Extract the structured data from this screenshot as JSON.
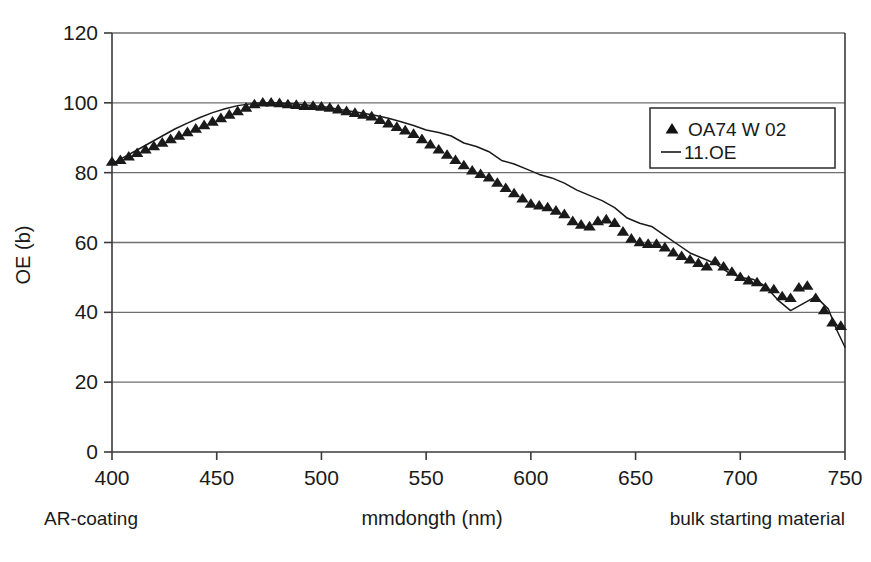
{
  "chart_data": {
    "type": "line",
    "title": "",
    "xlabel": "mmdongth (nm)",
    "ylabel": "OE (b)",
    "xlim": [
      400,
      750
    ],
    "ylim": [
      0,
      120
    ],
    "xticks": [
      400,
      450,
      500,
      550,
      600,
      650,
      700,
      750
    ],
    "yticks": [
      0,
      20,
      40,
      60,
      80,
      100,
      120
    ],
    "grid": "horizontal",
    "legend_position": "upper-right",
    "series": [
      {
        "name": "OA74 W 02",
        "marker": "triangle",
        "style": "markers",
        "x": [
          400,
          404,
          408,
          412,
          416,
          420,
          424,
          428,
          432,
          436,
          440,
          444,
          448,
          452,
          456,
          460,
          464,
          468,
          472,
          476,
          480,
          484,
          488,
          492,
          496,
          500,
          504,
          508,
          512,
          516,
          520,
          524,
          528,
          532,
          536,
          540,
          544,
          548,
          552,
          556,
          560,
          564,
          568,
          572,
          576,
          580,
          584,
          588,
          592,
          596,
          600,
          604,
          608,
          612,
          616,
          620,
          624,
          628,
          632,
          636,
          640,
          644,
          648,
          652,
          656,
          660,
          664,
          668,
          672,
          676,
          680,
          684,
          688,
          692,
          696,
          700,
          704,
          708,
          712,
          716,
          720,
          724,
          728,
          732,
          736,
          740,
          744,
          748
        ],
        "y": [
          83,
          83.5,
          84.5,
          85.5,
          86.5,
          87.5,
          88.5,
          89.5,
          90.5,
          91.5,
          92.5,
          93.5,
          94.5,
          95.5,
          96.5,
          97.5,
          98.5,
          99.5,
          100,
          100,
          99.8,
          99.5,
          99.3,
          99,
          99,
          98.8,
          98.5,
          98,
          97.5,
          97,
          96.5,
          96,
          95,
          94,
          93,
          92,
          91,
          89.5,
          88,
          86.5,
          85,
          83.5,
          82,
          80.5,
          79.5,
          78.5,
          77,
          75.5,
          74,
          72.5,
          71,
          70.5,
          70,
          69,
          68,
          66,
          65,
          64.5,
          66,
          66.5,
          65.5,
          63,
          61,
          60,
          59.5,
          59.5,
          58.5,
          57,
          56,
          55,
          54,
          53,
          54.5,
          53,
          51.5,
          50,
          49,
          48.5,
          47,
          46.5,
          44.5,
          44,
          47,
          47.5,
          44,
          40.5,
          37,
          36
        ]
      },
      {
        "name": "11.OE",
        "marker": "none",
        "style": "line",
        "x": [
          400,
          406,
          412,
          418,
          424,
          430,
          436,
          442,
          448,
          454,
          460,
          466,
          472,
          478,
          484,
          490,
          496,
          502,
          508,
          514,
          520,
          526,
          532,
          538,
          544,
          550,
          556,
          562,
          568,
          574,
          580,
          586,
          592,
          598,
          604,
          610,
          616,
          622,
          628,
          634,
          640,
          646,
          652,
          658,
          664,
          670,
          676,
          682,
          688,
          694,
          700,
          706,
          712,
          718,
          724,
          730,
          736,
          742,
          746,
          750
        ],
        "y": [
          82.5,
          84.5,
          86.5,
          88.5,
          90.5,
          92.5,
          94.2,
          95.8,
          97.2,
          98.3,
          99.2,
          99.7,
          100,
          100,
          99.8,
          99.5,
          99.2,
          98.8,
          98.2,
          97.6,
          97,
          96.4,
          95.6,
          94.6,
          93.5,
          92.2,
          91.5,
          90.5,
          88.5,
          87.5,
          86,
          83.5,
          82.5,
          81,
          79.5,
          78.5,
          77,
          75,
          73.5,
          72,
          70,
          67,
          65.5,
          64.5,
          62,
          59.5,
          57,
          55.5,
          54,
          51.5,
          50,
          49.5,
          47.5,
          43.5,
          40.5,
          42.5,
          44.5,
          41,
          35,
          30
        ]
      }
    ],
    "annotations": [
      {
        "text": "AR-coating",
        "position": "bottom-left"
      },
      {
        "text": "bulk starting material",
        "position": "bottom-right"
      }
    ]
  },
  "axis": {
    "ylabel": "OE (b)",
    "xlabel": "mmdongth (nm)",
    "xticks": [
      "400",
      "450",
      "500",
      "550",
      "600",
      "650",
      "700",
      "750"
    ],
    "yticks": [
      "120",
      "100",
      "80",
      "60",
      "40",
      "20",
      "0"
    ]
  },
  "legend": {
    "entries": [
      {
        "label": "OA74 W 02",
        "symbol": "triangle-marker"
      },
      {
        "label": "11.OE",
        "symbol": "line-swatch"
      }
    ]
  },
  "annotations": {
    "left": "AR-coating",
    "right": "bulk starting material"
  },
  "colors": {
    "ink": "#1a1a1a",
    "grid": "#6e6e6e",
    "axis": "#3a3a3a",
    "background": "#ffffff"
  }
}
